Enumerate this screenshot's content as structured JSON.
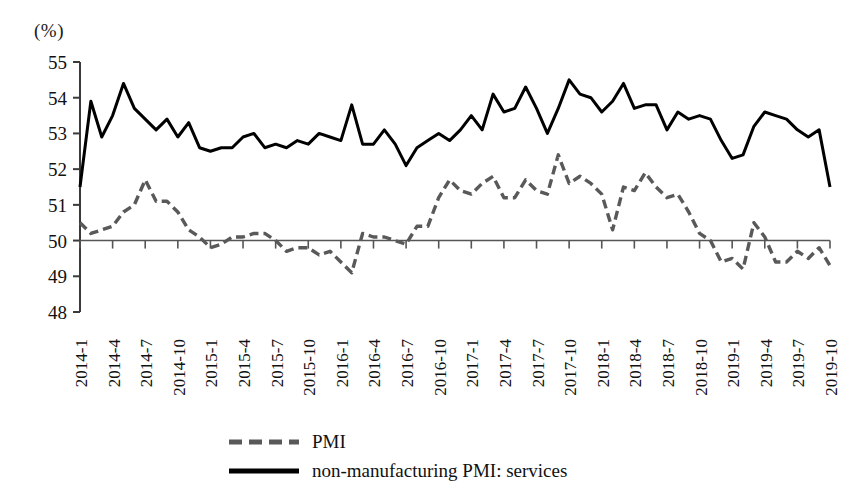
{
  "axis": {
    "unit_label": "(%)",
    "y_ticks": [
      "55",
      "54",
      "53",
      "52",
      "51",
      "50",
      "49",
      "48"
    ],
    "x_ticks": [
      "2014-1",
      "2014-4",
      "2014-7",
      "2014-10",
      "2015-1",
      "2015-4",
      "2015-7",
      "2015-10",
      "2016-1",
      "2016-4",
      "2016-7",
      "2016-10",
      "2017-1",
      "2017-4",
      "2017-7",
      "2017-10",
      "2018-1",
      "2018-4",
      "2018-7",
      "2018-10",
      "2019-1",
      "2019-4",
      "2019-7",
      "2019-10"
    ]
  },
  "legend": {
    "items": [
      {
        "label": "PMI",
        "style": "dashed",
        "color": "#595959"
      },
      {
        "label": "non-manufacturing PMI: services",
        "style": "solid",
        "color": "#000000"
      }
    ]
  },
  "chart_data": {
    "type": "line",
    "title": "",
    "xlabel": "",
    "ylabel": "(%)",
    "ylim": [
      48,
      55
    ],
    "grid": false,
    "reference_line": 50,
    "legend_position": "bottom",
    "x": [
      "2014-1",
      "2014-2",
      "2014-3",
      "2014-4",
      "2014-5",
      "2014-6",
      "2014-7",
      "2014-8",
      "2014-9",
      "2014-10",
      "2014-11",
      "2014-12",
      "2015-1",
      "2015-2",
      "2015-3",
      "2015-4",
      "2015-5",
      "2015-6",
      "2015-7",
      "2015-8",
      "2015-9",
      "2015-10",
      "2015-11",
      "2015-12",
      "2016-1",
      "2016-2",
      "2016-3",
      "2016-4",
      "2016-5",
      "2016-6",
      "2016-7",
      "2016-8",
      "2016-9",
      "2016-10",
      "2016-11",
      "2016-12",
      "2017-1",
      "2017-2",
      "2017-3",
      "2017-4",
      "2017-5",
      "2017-6",
      "2017-7",
      "2017-8",
      "2017-9",
      "2017-10",
      "2017-11",
      "2017-12",
      "2018-1",
      "2018-2",
      "2018-3",
      "2018-4",
      "2018-5",
      "2018-6",
      "2018-7",
      "2018-8",
      "2018-9",
      "2018-10",
      "2018-11",
      "2018-12",
      "2019-1",
      "2019-2",
      "2019-3",
      "2019-4",
      "2019-5",
      "2019-6",
      "2019-7",
      "2019-8",
      "2019-9",
      "2019-10"
    ],
    "x_tick_labels": [
      "2014-1",
      "2014-4",
      "2014-7",
      "2014-10",
      "2015-1",
      "2015-4",
      "2015-7",
      "2015-10",
      "2016-1",
      "2016-4",
      "2016-7",
      "2016-10",
      "2017-1",
      "2017-4",
      "2017-7",
      "2017-10",
      "2018-1",
      "2018-4",
      "2018-7",
      "2018-10",
      "2019-1",
      "2019-4",
      "2019-7",
      "2019-10"
    ],
    "x_tick_every": 3,
    "series": [
      {
        "name": "PMI",
        "style": "dashed",
        "color": "#595959",
        "values": [
          50.5,
          50.2,
          50.3,
          50.4,
          50.8,
          51.0,
          51.7,
          51.1,
          51.1,
          50.8,
          50.3,
          50.1,
          49.8,
          49.9,
          50.1,
          50.1,
          50.2,
          50.2,
          50.0,
          49.7,
          49.8,
          49.8,
          49.6,
          49.7,
          49.4,
          49.1,
          50.2,
          50.1,
          50.1,
          50.0,
          49.9,
          50.4,
          50.4,
          51.2,
          51.7,
          51.4,
          51.3,
          51.6,
          51.8,
          51.2,
          51.2,
          51.7,
          51.4,
          51.3,
          52.4,
          51.6,
          51.8,
          51.6,
          51.3,
          50.3,
          51.5,
          51.4,
          51.9,
          51.5,
          51.2,
          51.3,
          50.8,
          50.2,
          50.0,
          49.4,
          49.5,
          49.2,
          50.5,
          50.1,
          49.4,
          49.4,
          49.7,
          49.5,
          49.8,
          49.3
        ]
      },
      {
        "name": "non-manufacturing PMI: services",
        "style": "solid",
        "color": "#000000",
        "values": [
          51.5,
          53.9,
          52.9,
          53.5,
          54.4,
          53.7,
          53.4,
          53.1,
          53.4,
          52.9,
          53.3,
          52.6,
          52.5,
          52.6,
          52.6,
          52.9,
          53.0,
          52.6,
          52.7,
          52.6,
          52.8,
          52.7,
          53.0,
          52.9,
          52.8,
          53.8,
          52.7,
          52.7,
          53.1,
          52.7,
          52.1,
          52.6,
          52.8,
          53.0,
          52.8,
          53.1,
          53.5,
          53.1,
          54.1,
          53.6,
          53.7,
          54.3,
          53.7,
          53.0,
          53.7,
          54.5,
          54.1,
          54.0,
          53.6,
          53.9,
          54.4,
          53.7,
          53.8,
          53.8,
          53.1,
          53.6,
          53.4,
          53.5,
          53.4,
          52.8,
          52.3,
          52.4,
          53.2,
          53.6,
          53.5,
          53.4,
          53.1,
          52.9,
          53.1,
          51.5
        ]
      }
    ]
  }
}
